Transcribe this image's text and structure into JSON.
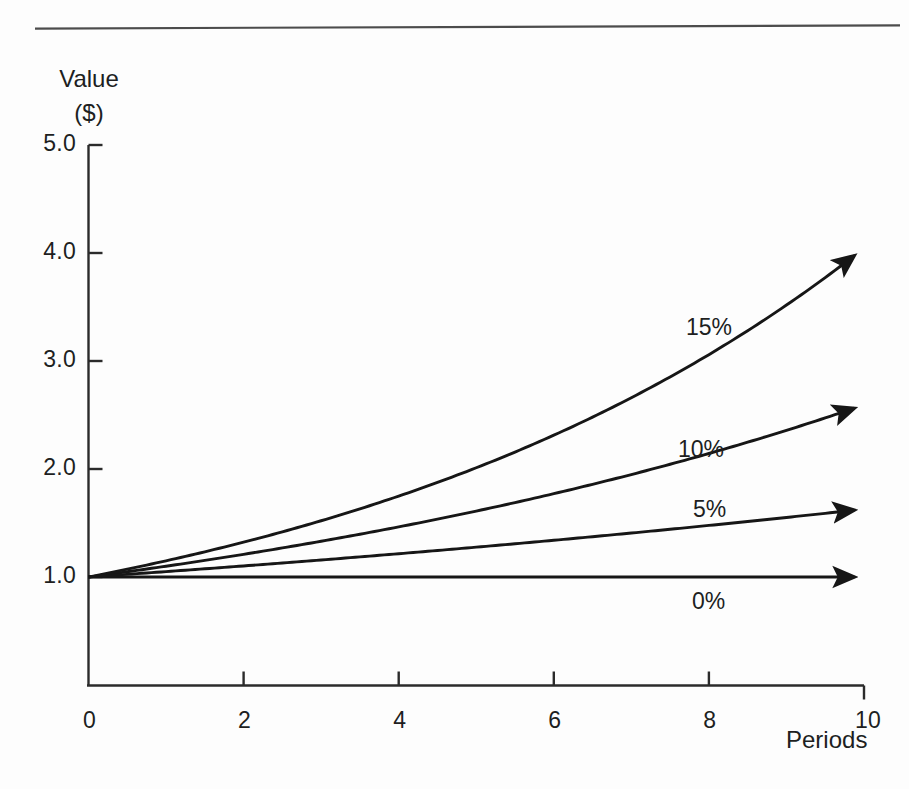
{
  "chart_data": {
    "type": "line",
    "title": "",
    "ylabel_line1": "Value",
    "ylabel_line2": "($)",
    "xlabel": "Periods",
    "xlim": [
      0,
      10
    ],
    "ylim": [
      0,
      5
    ],
    "xticks": [
      "0",
      "2",
      "4",
      "6",
      "8",
      "10"
    ],
    "xtick_values": [
      0,
      2,
      4,
      6,
      8,
      10
    ],
    "yticks": [
      "1.0",
      "2.0",
      "3.0",
      "4.0",
      "5.0"
    ],
    "ytick_values": [
      1,
      2,
      3,
      4,
      5
    ],
    "grid": false,
    "legend": "inline-annotations",
    "x": [
      0,
      1,
      2,
      3,
      4,
      5,
      6,
      7,
      8,
      9,
      10
    ],
    "series": [
      {
        "name": "15%",
        "rate": 0.15,
        "values": [
          1.0,
          1.15,
          1.32,
          1.52,
          1.75,
          2.01,
          2.31,
          2.66,
          3.06,
          3.52,
          4.05
        ],
        "label": "15%",
        "label_x_px": 686,
        "label_y_px": 314,
        "end_value": 4.05
      },
      {
        "name": "10%",
        "rate": 0.1,
        "values": [
          1.0,
          1.1,
          1.21,
          1.33,
          1.46,
          1.61,
          1.77,
          1.95,
          2.14,
          2.36,
          2.59
        ],
        "label": "10%",
        "label_x_px": 678,
        "label_y_px": 436,
        "end_value": 2.59
      },
      {
        "name": "5%",
        "rate": 0.05,
        "values": [
          1.0,
          1.05,
          1.1,
          1.16,
          1.22,
          1.28,
          1.34,
          1.41,
          1.48,
          1.55,
          1.63
        ],
        "label": "5%",
        "label_x_px": 693,
        "label_y_px": 496,
        "end_value": 1.63
      },
      {
        "name": "0%",
        "rate": 0.0,
        "values": [
          1.0,
          1.0,
          1.0,
          1.0,
          1.0,
          1.0,
          1.0,
          1.0,
          1.0,
          1.0,
          1.0
        ],
        "label": "0%",
        "label_x_px": 692,
        "label_y_px": 588,
        "end_value": 1.0
      }
    ],
    "line_color": "#161616",
    "axis_color": "#2b2b2b",
    "background": "#fdfdfd"
  }
}
